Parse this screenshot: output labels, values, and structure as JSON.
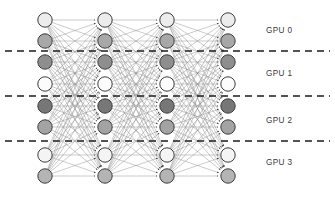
{
  "figure": {
    "title": "",
    "type": "neural-network-model-parallelism-diagram",
    "width": 335,
    "height": 198,
    "background_color": "#ffffff"
  },
  "network": {
    "description": "Fully connected feed-forward neural network with four node columns, each column containing eight nodes, partitioned horizontally across four GPUs.",
    "layer_count": 4,
    "nodes_per_layer": 8,
    "layer_x": [
      45,
      105,
      167,
      228
    ],
    "node_y": [
      20,
      41,
      62,
      84,
      106,
      127,
      155,
      176
    ],
    "node_radius": 7.2,
    "node_stroke_color": "#3c3c3c",
    "node_stroke_width": 1.0,
    "node_fill_colors": [
      "#ececec",
      "#a8a8a8",
      "#8e8e8e",
      "#fcfcfc",
      "#777777",
      "#a3a3a3",
      "#f4f4f4",
      "#b4b4b4"
    ],
    "edge_color": "#8a8a8a",
    "edge_width": 0.45,
    "arrow_color": "#2b2b2b",
    "fully_connected": true
  },
  "partitions": {
    "divider_color": "#1c1c1c",
    "divider_width": 1.7,
    "divider_dash": "7,5",
    "divider_x_start": 5,
    "divider_x_end": 330,
    "divider_y": [
      51,
      96,
      141
    ],
    "labels": [
      {
        "text": "GPU 0",
        "x": 266,
        "y": 33
      },
      {
        "text": "GPU 1",
        "x": 266,
        "y": 76
      },
      {
        "text": "GPU 2",
        "x": 266,
        "y": 123
      },
      {
        "text": "GPU 3",
        "x": 266,
        "y": 165
      }
    ]
  },
  "chart_data": {
    "type": "diagram",
    "layers": 4,
    "nodes_per_layer": 8,
    "gpu_partitions": [
      "GPU 0",
      "GPU 1",
      "GPU 2",
      "GPU 3"
    ],
    "nodes_per_gpu": 2,
    "connections": "dense (all-to-all between adjacent layers)"
  }
}
